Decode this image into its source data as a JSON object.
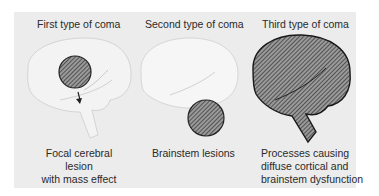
{
  "figure": {
    "panels": [
      {
        "title": "First type of coma",
        "caption_lines": [
          "Focal cerebral lesion",
          "with mass effect"
        ],
        "lesion": "focal cerebral circle with downward arrow"
      },
      {
        "title": "Second type of coma",
        "caption_lines": [
          "Brainstem lesions"
        ],
        "lesion": "brainstem circle"
      },
      {
        "title": "Third type of coma",
        "caption_lines": [
          "Processes causing",
          "diffuse cortical and",
          "brainstem dysfunction"
        ],
        "lesion": "entire brain hatched"
      }
    ],
    "colors": {
      "background": "#ececec",
      "brain_fill": "#f5f5f5",
      "hatch": "#333333",
      "hatch_fill": "#8a8a8a"
    }
  }
}
